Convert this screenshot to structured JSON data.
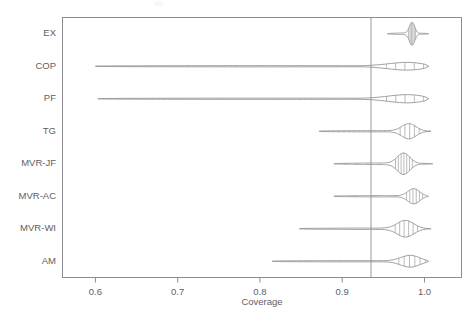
{
  "chart_data": {
    "type": "area",
    "title": "",
    "subtitle": "",
    "xlabel": "Coverage",
    "ylabel": "",
    "xlim": [
      0.56,
      1.045
    ],
    "xticks": [
      0.6,
      0.7,
      0.8,
      0.9,
      1.0
    ],
    "xticklabels": [
      "0.6",
      "0.7",
      "0.8",
      "0.9",
      "1.0"
    ],
    "grid": false,
    "legend": null,
    "reference_line": {
      "x": 0.96,
      "label": "",
      "orientation": "vertical"
    },
    "plot_style": "violin / density ridgeline with vertical hatch shading",
    "categories": [
      "EX",
      "COP",
      "PF",
      "TG",
      "MVR-JF",
      "MVR-AC",
      "MVR-WI",
      "AM"
    ],
    "series": [
      {
        "name": "EX",
        "min": 0.955,
        "max": 1.005,
        "peak": 0.985,
        "median": 0.985,
        "width": 0.05,
        "max_density": 1.0,
        "shape": "compact block, pointed left tail, blunt right edge",
        "hatch_lines": 6
      },
      {
        "name": "COP",
        "min": 0.6,
        "max": 1.005,
        "peak": 0.988,
        "median": 0.985,
        "width": 0.405,
        "max_density": 0.62,
        "shape": "very long thin left tail from 0.60, narrow bulge at right",
        "hatch_lines": 5
      },
      {
        "name": "PF",
        "min": 0.603,
        "max": 1.005,
        "peak": 0.988,
        "median": 0.985,
        "width": 0.402,
        "max_density": 0.66,
        "shape": "very long thin left tail from 0.60, narrow bulge at right",
        "hatch_lines": 5
      },
      {
        "name": "TG",
        "min": 0.872,
        "max": 1.008,
        "peak": 0.982,
        "median": 0.98,
        "width": 0.136,
        "max_density": 0.8,
        "shape": "needle tail from 0.87, rounded bulge near 0.98",
        "hatch_lines": 5
      },
      {
        "name": "MVR-JF",
        "min": 0.89,
        "max": 1.01,
        "peak": 0.975,
        "median": 0.972,
        "width": 0.12,
        "max_density": 1.0,
        "shape": "symmetric lens / leaf, widest body of all rows",
        "hatch_lines": 7
      },
      {
        "name": "MVR-AC",
        "min": 0.89,
        "max": 1.005,
        "peak": 0.988,
        "median": 0.983,
        "width": 0.115,
        "max_density": 0.86,
        "shape": "thin tail then wedge widening to the right",
        "hatch_lines": 6
      },
      {
        "name": "MVR-WI",
        "min": 0.848,
        "max": 1.008,
        "peak": 0.978,
        "median": 0.975,
        "width": 0.16,
        "max_density": 0.88,
        "shape": "long tail from 0.85, spindle bulge near 0.98",
        "hatch_lines": 6
      },
      {
        "name": "AM",
        "min": 0.815,
        "max": 1.005,
        "peak": 0.985,
        "median": 0.982,
        "width": 0.19,
        "max_density": 0.74,
        "shape": "long flat tail from 0.82, blocky body at right",
        "hatch_lines": 6
      }
    ]
  },
  "axis": {
    "x_title": "Coverage",
    "x_tick_labels": [
      "0.6",
      "0.7",
      "0.8",
      "0.9",
      "1.0"
    ],
    "y_tick_labels": [
      "EX",
      "COP",
      "PF",
      "TG",
      "MVR-JF",
      "MVR-AC",
      "MVR-WI",
      "AM"
    ]
  },
  "colors": {
    "background": "#ffffff",
    "axis": "#8c8c92",
    "text": "#5e5e63",
    "violin_stroke": "#8f8f95",
    "reference_line": "#9a9aa0"
  }
}
